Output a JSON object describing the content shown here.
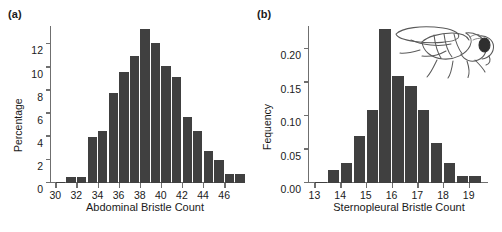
{
  "figure": {
    "panel_a_label": "(a)",
    "panel_b_label": "(b)",
    "bar_color": "#404040",
    "axis_color": "#6f6f6f",
    "background": "#ffffff",
    "illustration": "fruit-fly-line-drawing"
  },
  "chart_data": [
    {
      "type": "bar",
      "panel": "(a)",
      "title": "",
      "xlabel": "Abdominal Bristle Count",
      "ylabel": "Percentage",
      "xlim": [
        29.5,
        47.5
      ],
      "ylim": [
        0,
        13.6
      ],
      "grid": false,
      "legend": null,
      "xticks": [
        30,
        32,
        34,
        36,
        38,
        40,
        42,
        44,
        46
      ],
      "xticklabels": [
        "30",
        "32",
        "34",
        "36",
        "38",
        "40",
        "42",
        "44",
        "46"
      ],
      "yticks": [
        0,
        2,
        4,
        6,
        8,
        10,
        12
      ],
      "yticklabels": [
        "0",
        "2",
        "4",
        "6",
        "8",
        "10",
        "12"
      ],
      "categories": [
        30,
        31,
        32,
        33,
        34,
        35,
        36,
        37,
        38,
        39,
        40,
        41,
        42,
        43,
        44,
        45,
        46,
        47
      ],
      "values": [
        0.1,
        0.5,
        0.5,
        4.0,
        4.5,
        7.8,
        9.6,
        11.0,
        13.3,
        12.1,
        10.1,
        9.2,
        5.7,
        4.5,
        2.8,
        2.0,
        0.8,
        0.8
      ]
    },
    {
      "type": "bar",
      "panel": "(b)",
      "title": "",
      "xlabel": "Sternopleural Bristle Count",
      "ylabel": "Fequency",
      "xlim": [
        12.75,
        19.75
      ],
      "ylim": [
        0,
        0.235
      ],
      "grid": false,
      "legend": null,
      "xticks": [
        13,
        14,
        15,
        16,
        17,
        18,
        19
      ],
      "xticklabels": [
        "13",
        "14",
        "15",
        "16",
        "17",
        "18",
        "19"
      ],
      "yticks": [
        0.0,
        0.05,
        0.1,
        0.15,
        0.2
      ],
      "yticklabels": [
        "0.00",
        "0.05",
        "0.10",
        "0.15",
        "0.20"
      ],
      "categories": [
        13,
        13.5,
        14,
        14.5,
        15,
        15.5,
        16,
        16.5,
        17,
        17.5,
        18,
        18.5,
        19,
        19.5
      ],
      "values": [
        0.002,
        0.02,
        0.03,
        0.07,
        0.11,
        0.23,
        0.16,
        0.145,
        0.11,
        0.06,
        0.03,
        0.01,
        0.01,
        0.0
      ]
    }
  ]
}
